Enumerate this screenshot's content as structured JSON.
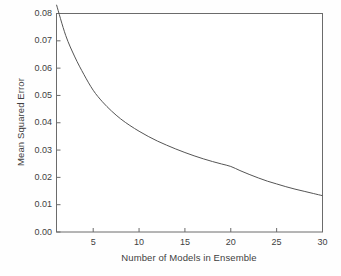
{
  "chart_data": {
    "type": "line",
    "title": "",
    "xlabel": "Number of Models in Ensemble",
    "ylabel": "Mean Squared Error",
    "xlim": [
      1,
      30
    ],
    "ylim": [
      0.0,
      0.08
    ],
    "grid": false,
    "legend": null,
    "xticks": [
      5,
      10,
      15,
      20,
      25,
      30
    ],
    "xtick_labels": [
      "5",
      "10",
      "15",
      "20",
      "25",
      "30"
    ],
    "yticks": [
      0.0,
      0.01,
      0.02,
      0.03,
      0.04,
      0.05,
      0.06,
      0.07,
      0.08
    ],
    "ytick_labels": [
      "0.00",
      "0.01",
      "0.02",
      "0.03",
      "0.04",
      "0.05",
      "0.06",
      "0.07",
      "0.08"
    ],
    "series": [
      {
        "name": "Mean Squared Error",
        "color": "#555555",
        "x": [
          1,
          2,
          3,
          4,
          5,
          6,
          7,
          8,
          9,
          10,
          11,
          12,
          13,
          14,
          15,
          16,
          17,
          18,
          19,
          20,
          21,
          22,
          23,
          24,
          25,
          26,
          27,
          28,
          29,
          30
        ],
        "values": [
          0.0832,
          0.072,
          0.0641,
          0.0576,
          0.0519,
          0.0477,
          0.0443,
          0.0414,
          0.039,
          0.0369,
          0.035,
          0.0333,
          0.0318,
          0.0304,
          0.0291,
          0.0279,
          0.0268,
          0.0258,
          0.0249,
          0.024,
          0.0225,
          0.0211,
          0.0198,
          0.0186,
          0.0176,
          0.0166,
          0.0157,
          0.0149,
          0.0141,
          0.0133
        ]
      }
    ]
  },
  "figure": {
    "background_color": "#fefefe",
    "axis_color": "#6b6b6b",
    "text_color": "#3f3f3f"
  }
}
